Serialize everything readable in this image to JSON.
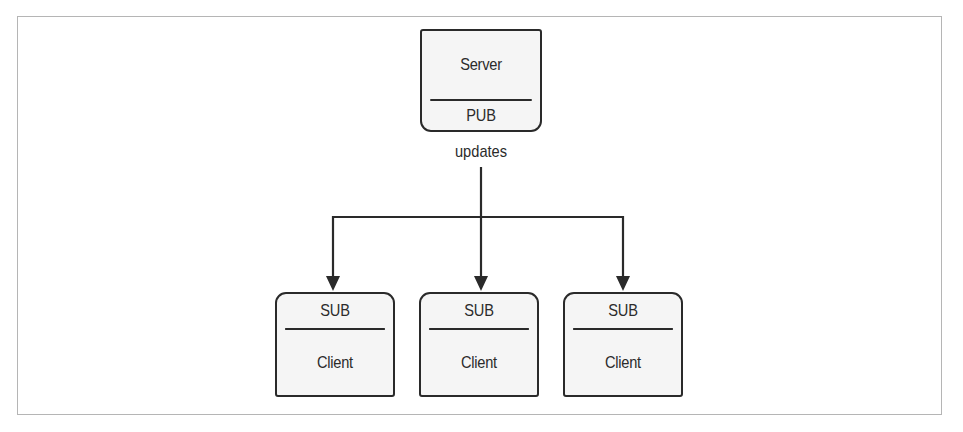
{
  "diagram": {
    "server": {
      "name": "Server",
      "socket": "PUB"
    },
    "edge_label": "updates",
    "clients": [
      {
        "socket": "SUB",
        "name": "Client"
      },
      {
        "socket": "SUB",
        "name": "Client"
      },
      {
        "socket": "SUB",
        "name": "Client"
      }
    ]
  },
  "colors": {
    "stroke": "#2a2a2a",
    "box_fill": "#f5f5f5",
    "frame": "#b5b5b5",
    "background": "#ffffff"
  }
}
